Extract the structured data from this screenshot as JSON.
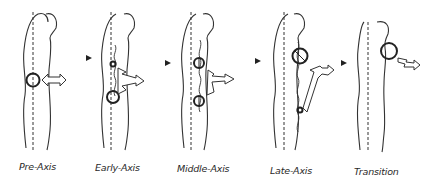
{
  "stages": [
    {
      "id": "pre-axis",
      "label": "Pre-Axis"
    },
    {
      "id": "early-axis",
      "label": "Early-Axis"
    },
    {
      "id": "middle-axis",
      "label": "Middle-Axis"
    },
    {
      "id": "late-axis",
      "label": "Late-Axis"
    },
    {
      "id": "transition",
      "label": "Transition"
    }
  ],
  "colors": {
    "line": "#333333",
    "background": "#ffffff"
  }
}
